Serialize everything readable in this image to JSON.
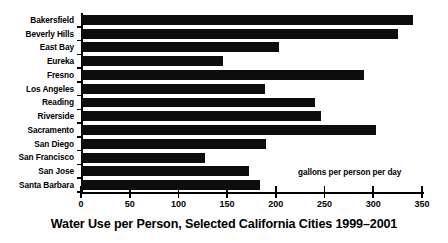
{
  "chart_data": {
    "type": "bar",
    "orientation": "horizontal",
    "title": "Water Use per Person, Selected California Cities 1999–2001",
    "xlabel": "gallons per person per day",
    "ylabel": "",
    "xlim": [
      0,
      350
    ],
    "grid": false,
    "legend": false,
    "annotations": [
      "gallons per person per day"
    ],
    "xticks": [
      0,
      50,
      100,
      150,
      200,
      250,
      300,
      350
    ],
    "xtick_labels": [
      "0",
      "50",
      "100",
      "150",
      "200",
      "250",
      "300",
      "350"
    ],
    "categories": [
      "Bakersfield",
      "Beverly Hills",
      "East Bay",
      "Eureka",
      "Fresno",
      "Los Angeles",
      "Reading",
      "Riverside",
      "Sacramento",
      "San Diego",
      "San Francisco",
      "San Jose",
      "Santa Barbara"
    ],
    "values": [
      340,
      324,
      202,
      145,
      289,
      188,
      239,
      245,
      302,
      189,
      126,
      171,
      183
    ],
    "series": [
      {
        "name": "gallons per person per day",
        "color": "#0d0d0d",
        "values": [
          340,
          324,
          202,
          145,
          289,
          188,
          239,
          245,
          302,
          189,
          126,
          171,
          183
        ]
      }
    ]
  }
}
